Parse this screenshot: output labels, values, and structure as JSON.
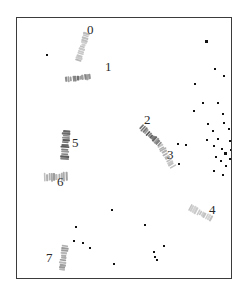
{
  "figure": {
    "title": "",
    "background_color": "#ffffff",
    "frame_color": "#3b3b3b",
    "frame": {
      "x": 16,
      "y": 17,
      "width": 216,
      "height": 262
    }
  },
  "chart_data": {
    "type": "scatter",
    "title": "",
    "xlabel": "",
    "ylabel": "",
    "grid": false,
    "legend": null,
    "xlim": [
      0,
      216
    ],
    "ylim": [
      0,
      262
    ],
    "objects": [
      {
        "label": "0",
        "x": 62,
        "y": 14,
        "length": 30,
        "width": 7,
        "angle": 18,
        "color": "#b4b4b4",
        "label_x": 70,
        "label_y": 5,
        "label_size": 13
      },
      {
        "label": "1",
        "x": 58,
        "y": 47,
        "length": 26,
        "width": 6,
        "angle": 83,
        "color": "#6e6e6e",
        "label_x": 88,
        "label_y": 42,
        "label_size": 13
      },
      {
        "label": "2",
        "x": 130,
        "y": 104,
        "length": 27,
        "width": 7,
        "angle": 133,
        "color": "#5a5a5a",
        "label_x": 127,
        "label_y": 95,
        "label_size": 13
      },
      {
        "label": "3",
        "x": 146,
        "y": 125,
        "length": 26,
        "width": 7,
        "angle": 150,
        "color": "#b0b0b0",
        "label_x": 150,
        "label_y": 130,
        "label_size": 13
      },
      {
        "label": "4",
        "x": 180,
        "y": 182,
        "length": 26,
        "width": 7,
        "angle": 118,
        "color": "#bdbdbd",
        "label_x": 192,
        "label_y": 185,
        "label_size": 13
      },
      {
        "label": "5",
        "x": 44,
        "y": 112,
        "length": 30,
        "width": 9,
        "angle": 4,
        "color": "#585858",
        "label_x": 55,
        "label_y": 118,
        "label_size": 13
      },
      {
        "label": "6",
        "x": 34,
        "y": 147,
        "length": 24,
        "width": 9,
        "angle": 88,
        "color": "#9a9a9a",
        "label_x": 40,
        "label_y": 157,
        "label_size": 13
      },
      {
        "label": "7",
        "x": 43,
        "y": 227,
        "length": 26,
        "width": 7,
        "angle": 7,
        "color": "#989898",
        "label_x": 29,
        "label_y": 233,
        "label_size": 13
      }
    ],
    "specks": [
      {
        "x": 188,
        "y": 22,
        "size": 3.2
      },
      {
        "x": 29,
        "y": 36,
        "size": 2.0
      },
      {
        "x": 197,
        "y": 50,
        "size": 2.0
      },
      {
        "x": 206,
        "y": 57,
        "size": 1.8
      },
      {
        "x": 177,
        "y": 65,
        "size": 1.8
      },
      {
        "x": 185,
        "y": 84,
        "size": 1.8
      },
      {
        "x": 176,
        "y": 92,
        "size": 1.8
      },
      {
        "x": 200,
        "y": 84,
        "size": 1.8
      },
      {
        "x": 205,
        "y": 95,
        "size": 1.8
      },
      {
        "x": 190,
        "y": 105,
        "size": 1.8
      },
      {
        "x": 206,
        "y": 104,
        "size": 1.8
      },
      {
        "x": 195,
        "y": 112,
        "size": 1.8
      },
      {
        "x": 211,
        "y": 110,
        "size": 1.8
      },
      {
        "x": 200,
        "y": 120,
        "size": 1.8
      },
      {
        "x": 189,
        "y": 121,
        "size": 1.8
      },
      {
        "x": 212,
        "y": 122,
        "size": 1.8
      },
      {
        "x": 160,
        "y": 125,
        "size": 1.8
      },
      {
        "x": 168,
        "y": 126,
        "size": 1.8
      },
      {
        "x": 196,
        "y": 127,
        "size": 1.8
      },
      {
        "x": 204,
        "y": 130,
        "size": 1.8
      },
      {
        "x": 207,
        "y": 134,
        "size": 3.4
      },
      {
        "x": 213,
        "y": 131,
        "size": 1.8
      },
      {
        "x": 216,
        "y": 126,
        "size": 1.8
      },
      {
        "x": 198,
        "y": 138,
        "size": 1.8
      },
      {
        "x": 203,
        "y": 142,
        "size": 1.8
      },
      {
        "x": 212,
        "y": 140,
        "size": 1.8
      },
      {
        "x": 208,
        "y": 147,
        "size": 1.8
      },
      {
        "x": 218,
        "y": 145,
        "size": 1.8
      },
      {
        "x": 161,
        "y": 145,
        "size": 1.8
      },
      {
        "x": 196,
        "y": 152,
        "size": 1.8
      },
      {
        "x": 205,
        "y": 156,
        "size": 1.8
      },
      {
        "x": 94,
        "y": 191,
        "size": 1.8
      },
      {
        "x": 58,
        "y": 208,
        "size": 1.8
      },
      {
        "x": 127,
        "y": 206,
        "size": 1.8
      },
      {
        "x": 146,
        "y": 227,
        "size": 1.8
      },
      {
        "x": 136,
        "y": 233,
        "size": 1.8
      },
      {
        "x": 137,
        "y": 238,
        "size": 1.8
      },
      {
        "x": 139,
        "y": 241,
        "size": 2.0
      },
      {
        "x": 56,
        "y": 222,
        "size": 1.8
      },
      {
        "x": 65,
        "y": 224,
        "size": 1.8
      },
      {
        "x": 72,
        "y": 229,
        "size": 1.8
      },
      {
        "x": 96,
        "y": 245,
        "size": 1.8
      }
    ]
  }
}
